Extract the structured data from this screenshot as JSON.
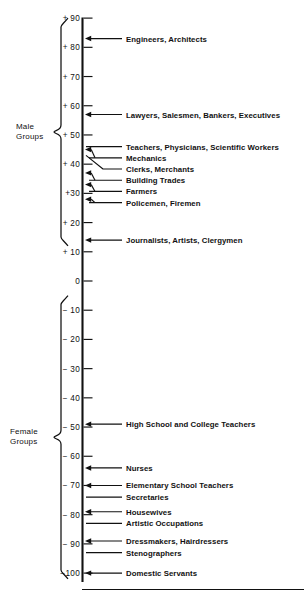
{
  "figure": {
    "type": "number-line-scale",
    "axis_orientation": "vertical",
    "background_color": "#ffffff",
    "ink_color": "#111111"
  },
  "groups": [
    {
      "name": "male",
      "label_line1": "Male",
      "label_line2": "Groups",
      "range_top": 90,
      "range_bottom": 12
    },
    {
      "name": "female",
      "label_line1": "Female",
      "label_line2": "Groups",
      "range_top": -5,
      "range_bottom": -102
    }
  ],
  "chart_data": {
    "type": "scatter",
    "title": "",
    "subtitle": "",
    "xlabel": "",
    "ylabel": "",
    "ylim": [
      -100,
      90
    ],
    "grid": false,
    "legend": "none",
    "axis_ticks": [
      {
        "label": "+ 90",
        "value": 90
      },
      {
        "label": "+ 80",
        "value": 80
      },
      {
        "label": "+ 70",
        "value": 70
      },
      {
        "label": "+ 60",
        "value": 60
      },
      {
        "label": "+ 50",
        "value": 50
      },
      {
        "label": "+ 40",
        "value": 40
      },
      {
        "label": "+30",
        "value": 30
      },
      {
        "label": "+ 20",
        "value": 20
      },
      {
        "label": "+ 10",
        "value": 10
      },
      {
        "label": "0",
        "value": 0
      },
      {
        "label": "− 10",
        "value": -10
      },
      {
        "label": "− 20",
        "value": -20
      },
      {
        "label": "− 30",
        "value": -30
      },
      {
        "label": "− 40",
        "value": -40
      },
      {
        "label": "− 50",
        "value": -50
      },
      {
        "label": "− 60",
        "value": -60
      },
      {
        "label": "− 70",
        "value": -70
      },
      {
        "label": "− 80",
        "value": -80
      },
      {
        "label": "− 90",
        "value": -90
      },
      {
        "label": "−100",
        "value": -100
      }
    ],
    "categories": [
      "Engineers, Architects",
      "Lawyers, Salesmen, Bankers, Executives",
      "Teachers, Physicians, Scientific Workers",
      "Mechanics",
      "Clerks, Merchants",
      "Building Trades",
      "Farmers",
      "Policemen, Firemen",
      "Journalists, Artists, Clergymen",
      "High School and College Teachers",
      "Nurses",
      "Elementary School Teachers",
      "Secretaries",
      "Housewives",
      "Artistic Occupations",
      "Dressmakers, Hairdressers",
      "Stenographers",
      "Domestic Servants"
    ],
    "values": [
      83,
      57,
      46,
      45,
      43,
      37,
      33,
      28,
      14,
      -49,
      -64,
      -70,
      -74,
      -79,
      -83,
      -89,
      -93,
      -100
    ],
    "points": [
      {
        "label": "Engineers, Architects",
        "value": 83,
        "group": "male",
        "connector": "arrow"
      },
      {
        "label": "Lawyers, Salesmen, Bankers, Executives",
        "value": 57,
        "group": "male",
        "connector": "arrow"
      },
      {
        "label": "Teachers, Physicians, Scientific Workers",
        "value": 46,
        "group": "male",
        "connector": "leader"
      },
      {
        "label": "Mechanics",
        "value": 45,
        "group": "male",
        "connector": "arrow"
      },
      {
        "label": "Clerks, Merchants",
        "value": 43,
        "group": "male",
        "connector": "leader"
      },
      {
        "label": "Building Trades",
        "value": 37,
        "group": "male",
        "connector": "arrow"
      },
      {
        "label": "Farmers",
        "value": 33,
        "group": "male",
        "connector": "arrow"
      },
      {
        "label": "Policemen, Firemen",
        "value": 28,
        "group": "male",
        "connector": "arrow"
      },
      {
        "label": "Journalists, Artists, Clergymen",
        "value": 14,
        "group": "male",
        "connector": "arrow"
      },
      {
        "label": "High School and College Teachers",
        "value": -49,
        "group": "female",
        "connector": "arrow"
      },
      {
        "label": "Nurses",
        "value": -64,
        "group": "female",
        "connector": "arrow"
      },
      {
        "label": "Elementary School Teachers",
        "value": -70,
        "group": "female",
        "connector": "arrow"
      },
      {
        "label": "Secretaries",
        "value": -74,
        "group": "female",
        "connector": "leader"
      },
      {
        "label": "Housewives",
        "value": -79,
        "group": "female",
        "connector": "arrow"
      },
      {
        "label": "Artistic Occupations",
        "value": -83,
        "group": "female",
        "connector": "leader"
      },
      {
        "label": "Dressmakers, Hairdressers",
        "value": -89,
        "group": "female",
        "connector": "arrow"
      },
      {
        "label": "Stenographers",
        "value": -93,
        "group": "female",
        "connector": "leader"
      },
      {
        "label": "Domestic Servants",
        "value": -100,
        "group": "female",
        "connector": "arrow"
      }
    ]
  }
}
